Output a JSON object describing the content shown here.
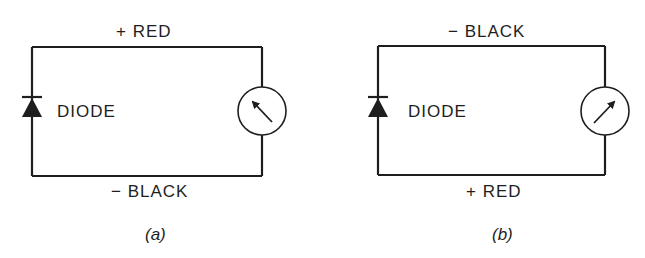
{
  "figure": {
    "panels": [
      {
        "id": "a",
        "caption": "(a)",
        "top_label": "+ RED",
        "bottom_label": "− BLACK",
        "component_label": "DIODE",
        "meter_needle": "pointing upper-left (deflection toward left)",
        "diode_orientation": "anode bottom, cathode top"
      },
      {
        "id": "b",
        "caption": "(b)",
        "top_label": "− BLACK",
        "bottom_label": "+ RED",
        "component_label": "DIODE",
        "meter_needle": "pointing upper-right (deflection toward right)",
        "diode_orientation": "anode bottom, cathode top"
      }
    ],
    "icons": {
      "diode": "diode-symbol-icon",
      "meter": "ohmmeter-dial-icon"
    }
  }
}
